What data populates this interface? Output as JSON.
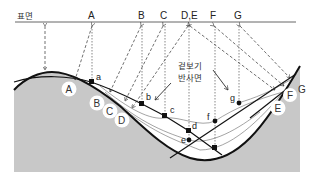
{
  "diagram": {
    "surface_label": "표면",
    "reflector_label_line1": "겉보기",
    "reflector_label_line2": "반사면",
    "surface_points": [
      "A",
      "B",
      "C",
      "D,E",
      "F",
      "G"
    ],
    "circle_labels": [
      "A",
      "B",
      "C",
      "D",
      "E",
      "F",
      "G"
    ],
    "reflection_points": [
      "a",
      "b",
      "c",
      "d",
      "e",
      "f",
      "g"
    ],
    "colors": {
      "ground": "#c8c8c8",
      "line": "#111111",
      "circle_fill": "#ffffff"
    }
  }
}
